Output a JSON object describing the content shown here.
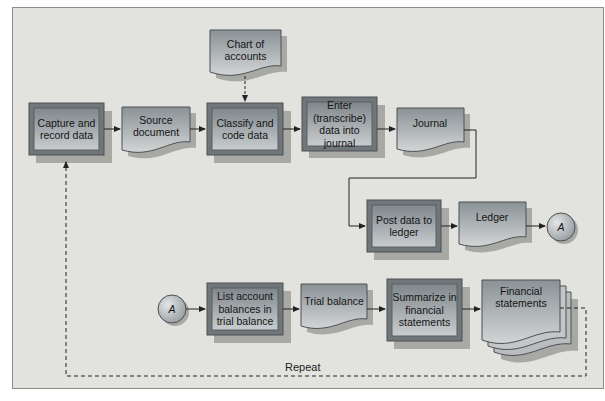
{
  "diagram": {
    "nodes": {
      "capture": {
        "type": "process",
        "label": "Capture and record data"
      },
      "source_document": {
        "type": "document",
        "label": "Source document"
      },
      "chart_of_accounts": {
        "type": "document",
        "label": "Chart of accounts"
      },
      "classify": {
        "type": "process",
        "label": "Classify and code data"
      },
      "enter": {
        "type": "process",
        "label": "Enter (transcribe) data into journal"
      },
      "journal": {
        "type": "document",
        "label": "Journal"
      },
      "post": {
        "type": "process",
        "label": "Post data to ledger"
      },
      "ledger": {
        "type": "document",
        "label": "Ledger"
      },
      "connector_out": {
        "type": "connector",
        "label": "A"
      },
      "connector_in": {
        "type": "connector",
        "label": "A"
      },
      "list_balances": {
        "type": "process",
        "label": "List account balances in trial balance"
      },
      "trial_balance": {
        "type": "document",
        "label": "Trial balance"
      },
      "summarize": {
        "type": "process",
        "label": "Summarize in financial statements"
      },
      "financial_statements": {
        "type": "multi-document",
        "label": "Financial statements"
      }
    },
    "repeat_label": "Repeat",
    "colors": {
      "background": "#e2e2df",
      "process_fill": "#8f979b",
      "document_fill": "#9ba3a6",
      "border": "#5a5e60",
      "shadow": "#a9a9a6"
    }
  }
}
